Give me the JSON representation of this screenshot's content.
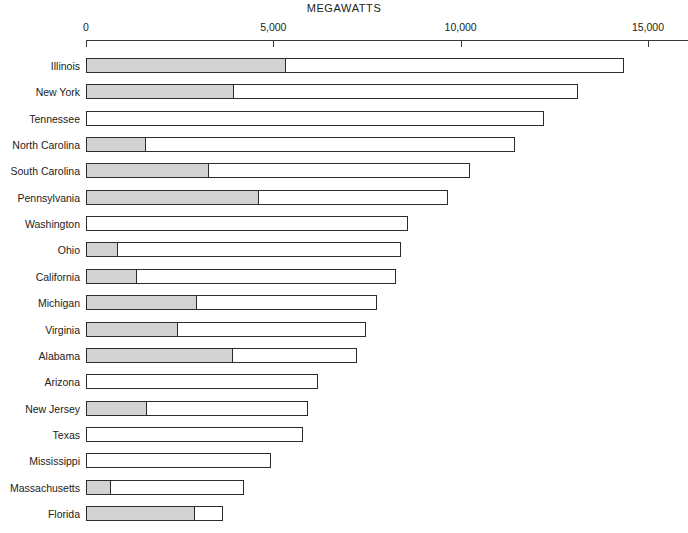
{
  "chart_data": {
    "type": "bar",
    "orientation": "horizontal",
    "title": "MEGAWATTS",
    "xlabel": "MEGAWATTS",
    "ylabel": "",
    "xlim": [
      0,
      16100
    ],
    "grid": false,
    "legend": null,
    "stacked": true,
    "tick_values": [
      0,
      5000,
      10000,
      15000
    ],
    "tick_labels": [
      "0",
      "5,000",
      "10,000",
      "15,000"
    ],
    "categories": [
      "Illinois",
      "New York",
      "Tennessee",
      "North Carolina",
      "South Carolina",
      "Pennsylvania",
      "Washington",
      "Ohio",
      "California",
      "Michigan",
      "Virginia",
      "Alabama",
      "Arizona",
      "New Jersey",
      "Texas",
      "Mississippi",
      "Massachusetts",
      "Florida"
    ],
    "series": [
      {
        "name": "shaded-segment",
        "color": "#d2d2d2",
        "values": [
          5320,
          3930,
          0,
          1580,
          3260,
          4590,
          0,
          830,
          1340,
          2940,
          2430,
          3900,
          0,
          1600,
          0,
          0,
          640,
          2880
        ]
      },
      {
        "name": "total",
        "color": "#ffffff",
        "values": [
          14350,
          13140,
          12230,
          11460,
          10260,
          9670,
          8600,
          8410,
          8280,
          7770,
          7480,
          7240,
          6200,
          5930,
          5800,
          4940,
          4220,
          3660
        ]
      }
    ]
  },
  "axis": {
    "title": "MEGAWATTS"
  }
}
